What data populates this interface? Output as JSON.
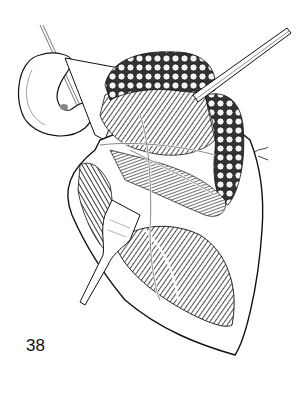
{
  "figure": {
    "number": "38"
  },
  "colors": {
    "ink": "#111111",
    "paper": "#ffffff",
    "shade": "#444444"
  }
}
